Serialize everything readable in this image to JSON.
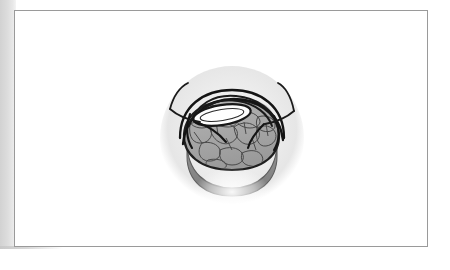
{
  "document": {
    "page_background": "#ffffff",
    "scan_edge_color": "#d2d2d2",
    "frame_border_color": "#9a9a9a",
    "frame": {
      "x": 14,
      "y": 10,
      "width": 414,
      "height": 237
    }
  },
  "figure": {
    "title": "",
    "caption": "",
    "palette": {
      "vignette_light": "#f6f6f6",
      "vignette_mid": "#ebebeb",
      "vignette_edge": "#e2e2e2",
      "dome_texture_fill": "#9c9c9c",
      "dome_texture_line": "#4f4f4f",
      "crescent_band": "#8d8d8d",
      "crescent_band_dark": "#7a7a7a",
      "highlight_ellipse": "#fbfbfb",
      "shadow_blob": "#a9a9a9",
      "outline": "#1c1c1c"
    },
    "geometry": {
      "vignette_center_x": 225,
      "vignette_center_y": 130,
      "vignette_radius": 70
    },
    "parts": [
      {
        "name": "vignette-circle",
        "label": "background vignette"
      },
      {
        "name": "upper-retractor-left",
        "label": "left retractor arm"
      },
      {
        "name": "upper-retractor-right",
        "label": "right retractor arm"
      },
      {
        "name": "loop-band-outer",
        "label": "outer loop band"
      },
      {
        "name": "loop-band-inner",
        "label": "inner loop band"
      },
      {
        "name": "highlight-ellipse",
        "label": "pale lens ellipse"
      },
      {
        "name": "shadow-dome",
        "label": "shaded dome"
      },
      {
        "name": "cobblestone-dome",
        "label": "textured dome"
      },
      {
        "name": "crescent-band",
        "label": "lower crescent band"
      }
    ]
  }
}
